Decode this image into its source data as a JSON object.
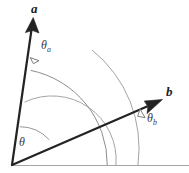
{
  "figure": {
    "type": "vector-angle-diagram",
    "width": 189,
    "height": 173,
    "background_color": "#ffffff",
    "labels": {
      "vector_a": "a",
      "vector_b": "b",
      "theta": "θ",
      "theta_a_base": "θ",
      "theta_a_sub": "a",
      "theta_b_base": "θ",
      "theta_b_sub": "b"
    },
    "colors": {
      "vector_stroke": "#222222",
      "arc_stroke": "#8a8a8a",
      "baseline_stroke": "#9a9a9a",
      "marker_fill": "#ffffff",
      "marker_stroke": "#6e6e6e",
      "label_color": "#1a1a1a"
    },
    "geometry": {
      "origin_x": 12,
      "origin_y": 165,
      "vector_a_tip_x": 31,
      "vector_a_tip_y": 18,
      "vector_b_tip_x": 161,
      "vector_b_tip_y": 100,
      "baseline_y": 165,
      "baseline_x_end": 189,
      "arc_radius_theta": 40,
      "arc_radius_mid": 64,
      "arc_radius_outer": 96,
      "arc_radius_far": 126
    }
  }
}
